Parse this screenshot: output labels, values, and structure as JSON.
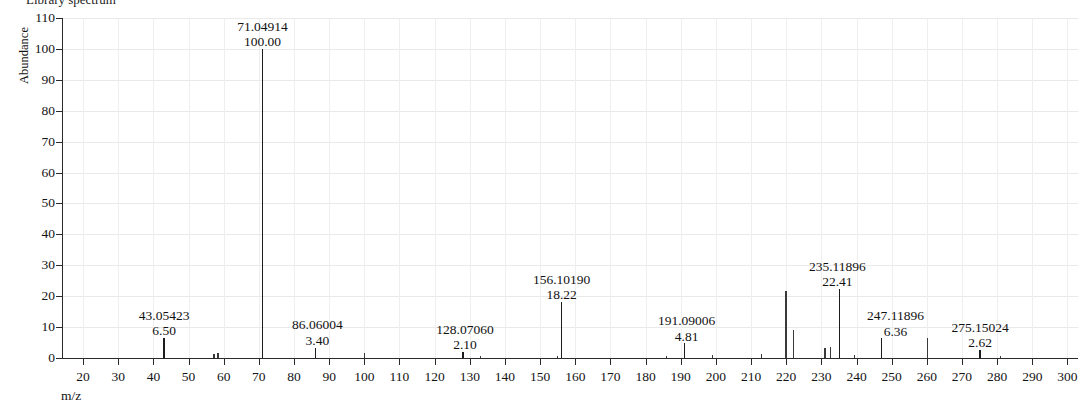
{
  "title": "Library spectrum",
  "axes": {
    "y_title": "Abundance",
    "x_title": "m/z",
    "y_ticks": [
      0,
      10,
      20,
      30,
      40,
      50,
      60,
      70,
      80,
      90,
      100,
      110
    ],
    "x_ticks": [
      20,
      30,
      40,
      50,
      60,
      70,
      80,
      90,
      100,
      110,
      120,
      130,
      140,
      150,
      160,
      170,
      180,
      190,
      200,
      210,
      220,
      230,
      240,
      250,
      260,
      270,
      280,
      290,
      300
    ]
  },
  "chart_data": {
    "type": "bar",
    "title": "Library spectrum",
    "xlabel": "m/z",
    "ylabel": "Abundance",
    "xlim": [
      14,
      303
    ],
    "ylim": [
      0,
      110
    ],
    "grid": true,
    "legend": "none",
    "labeled_peaks": [
      {
        "mz_label": "43.05423",
        "abundance_label": "6.50",
        "mz": 43.05423,
        "abundance": 6.5
      },
      {
        "mz_label": "71.04914",
        "abundance_label": "100.00",
        "mz": 71.04914,
        "abundance": 100.0
      },
      {
        "mz_label": "86.06004",
        "abundance_label": "3.40",
        "mz": 86.06004,
        "abundance": 3.4
      },
      {
        "mz_label": "128.07060",
        "abundance_label": "2.10",
        "mz": 128.0706,
        "abundance": 2.1
      },
      {
        "mz_label": "156.10190",
        "abundance_label": "18.22",
        "mz": 156.1019,
        "abundance": 18.22
      },
      {
        "mz_label": "191.09006",
        "abundance_label": "4.81",
        "mz": 191.09006,
        "abundance": 4.81
      },
      {
        "mz_label": "235.11896",
        "abundance_label": "22.41",
        "mz": 235.11896,
        "abundance": 22.41
      },
      {
        "mz_label": "247.11896",
        "abundance_label": "6.36",
        "mz": 247.11896,
        "abundance": 6.36
      },
      {
        "mz_label": "275.15024",
        "abundance_label": "2.62",
        "mz": 275.15024,
        "abundance": 2.62
      }
    ],
    "unlabeled_peaks": [
      {
        "mz": 57.2,
        "abundance": 1.4
      },
      {
        "mz": 58.4,
        "abundance": 1.5
      },
      {
        "mz": 100.1,
        "abundance": 1.5
      },
      {
        "mz": 133.1,
        "abundance": 0.8
      },
      {
        "mz": 155.0,
        "abundance": 0.7
      },
      {
        "mz": 186.0,
        "abundance": 0.7
      },
      {
        "mz": 199.0,
        "abundance": 1.1
      },
      {
        "mz": 213.0,
        "abundance": 1.4
      },
      {
        "mz": 219.9,
        "abundance": 21.8
      },
      {
        "mz": 222.1,
        "abundance": 9.0
      },
      {
        "mz": 231.0,
        "abundance": 3.1
      },
      {
        "mz": 232.6,
        "abundance": 3.6
      },
      {
        "mz": 239.5,
        "abundance": 1.0
      },
      {
        "mz": 260.2,
        "abundance": 6.5
      },
      {
        "mz": 281.0,
        "abundance": 0.6
      }
    ]
  }
}
